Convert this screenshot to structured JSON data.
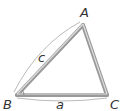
{
  "diagram": {
    "type": "triangle",
    "vertices": {
      "A": {
        "label": "A",
        "x": 83,
        "y": 25
      },
      "B": {
        "label": "B",
        "x": 17,
        "y": 95
      },
      "C": {
        "label": "C",
        "x": 107,
        "y": 95
      }
    },
    "sides": {
      "c": {
        "label": "c",
        "from": "B",
        "to": "A"
      },
      "a": {
        "label": "a",
        "from": "B",
        "to": "C"
      }
    },
    "angle_marker": {
      "vertex": "B"
    },
    "colors": {
      "edge": "#999999",
      "edge_highlight": "#cccccc",
      "text": "#333333",
      "arc": "#aaaaaa"
    }
  }
}
